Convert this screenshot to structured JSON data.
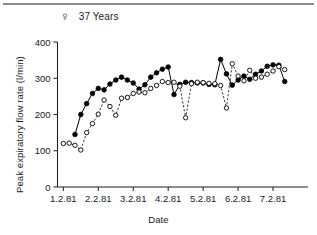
{
  "figure": {
    "sex_symbol": "♀",
    "age_label": "37 Years",
    "top_rule": "horizontal-rule"
  },
  "chart_data": {
    "type": "line",
    "title": "37 Years",
    "xlabel": "Date",
    "ylabel": "Peak expiratory flow rate (l/min)",
    "ylim": [
      0,
      400
    ],
    "yticks": [
      0,
      100,
      200,
      300,
      400
    ],
    "ytick_labels": [
      "0",
      "100",
      "200",
      "300",
      "400"
    ],
    "xlim": [
      0,
      43
    ],
    "xticks": [
      1,
      7,
      13,
      19,
      25,
      31,
      37
    ],
    "xtick_labels": [
      "1.2.81",
      "2.2.81",
      "3.2.81",
      "4.2.81",
      "5.2.81",
      "6.2.81",
      "7.2.81"
    ],
    "grid": false,
    "legend": "none",
    "series": [
      {
        "name": "Evening (filled circles, solid line)",
        "marker": "filled-circle",
        "linestyle": "solid",
        "color": "#000000",
        "x": [
          3,
          4,
          5,
          6,
          7,
          8,
          9,
          10,
          11,
          12,
          13,
          14,
          15,
          16,
          17,
          18,
          19,
          20,
          21,
          22,
          23,
          24,
          25,
          26,
          27,
          28,
          29,
          30,
          31,
          32,
          33,
          34,
          35,
          36,
          37,
          38,
          39
        ],
        "y": [
          145,
          200,
          230,
          258,
          272,
          268,
          284,
          295,
          303,
          295,
          287,
          270,
          282,
          303,
          315,
          325,
          331,
          255,
          283,
          289,
          288,
          287,
          287,
          283,
          282,
          352,
          312,
          281,
          295,
          306,
          297,
          311,
          320,
          333,
          337,
          336,
          291
        ]
      },
      {
        "name": "Morning (open circles, dashed line)",
        "marker": "open-circle",
        "linestyle": "dashed",
        "color": "#000000",
        "x": [
          1,
          2,
          3,
          4,
          5,
          6,
          7,
          8,
          9,
          10,
          11,
          12,
          13,
          14,
          15,
          16,
          17,
          18,
          19,
          20,
          21,
          22,
          23,
          24,
          25,
          26,
          27,
          28,
          29,
          30,
          31,
          32,
          33,
          34,
          35,
          36,
          37,
          38,
          39
        ],
        "y": [
          120,
          121,
          115,
          102,
          150,
          175,
          201,
          240,
          222,
          198,
          245,
          247,
          258,
          262,
          260,
          272,
          280,
          291,
          288,
          289,
          278,
          191,
          285,
          289,
          288,
          286,
          285,
          280,
          218,
          340,
          306,
          293,
          322,
          300,
          303,
          311,
          320,
          332,
          324
        ]
      }
    ]
  }
}
